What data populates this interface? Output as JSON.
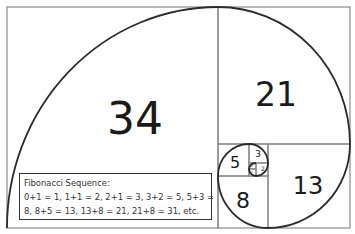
{
  "diagram": {
    "squares": [
      {
        "label": "34",
        "x": 7,
        "y": 7,
        "w": 211,
        "h": 221,
        "lx": 135,
        "ly": 119,
        "fs": 44
      },
      {
        "label": "21",
        "x": 218,
        "y": 7,
        "w": 132,
        "h": 137,
        "lx": 276,
        "ly": 94,
        "fs": 33
      },
      {
        "label": "13",
        "x": 268,
        "y": 144,
        "w": 82,
        "h": 84,
        "lx": 308,
        "ly": 186,
        "fs": 24
      },
      {
        "label": "8",
        "x": 218,
        "y": 176,
        "w": 50,
        "h": 52,
        "lx": 243,
        "ly": 201,
        "fs": 22
      },
      {
        "label": "5",
        "x": 218,
        "y": 144,
        "w": 31,
        "h": 32,
        "lx": 235,
        "ly": 163,
        "fs": 16
      },
      {
        "label": "3",
        "x": 249,
        "y": 144,
        "w": 19,
        "h": 19,
        "lx": 258,
        "ly": 154,
        "fs": 9
      },
      {
        "label": "2",
        "x": 256,
        "y": 163,
        "w": 12,
        "h": 13,
        "lx": 263,
        "ly": 169,
        "fs": 6
      },
      {
        "label": "1",
        "x": 249,
        "y": 163,
        "w": 7,
        "h": 6,
        "lx": 252,
        "ly": 166,
        "fs": 3
      },
      {
        "label": "1",
        "x": 249,
        "y": 169,
        "w": 7,
        "h": 7,
        "lx": 252,
        "ly": 172,
        "fs": 3
      }
    ]
  },
  "info_box": {
    "heading": "Fibonacci Sequence:",
    "line1": "0+1 = 1, 1+1 = 2, 2+1 = 3, 3+2 = 5, 5+3 =",
    "line2": "8, 8+5 = 13, 13+8 = 21, 21+8 = 31, etc."
  },
  "colors": {
    "grid_line": "#8a8a8a",
    "spiral": "#2b2b2b",
    "text": "#1a1a1a"
  }
}
